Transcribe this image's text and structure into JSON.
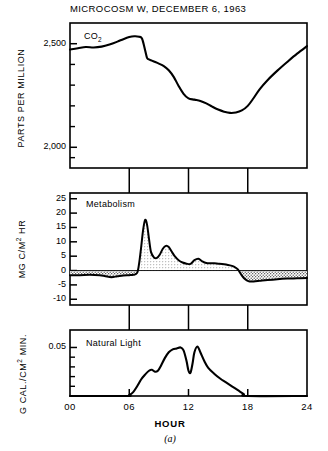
{
  "figure": {
    "title": "MICROCOSM W,  DECEMBER 6, 1963",
    "caption": "(a)",
    "xaxis_name": "HOUR"
  },
  "chart_data": [
    {
      "type": "line",
      "panel": "top",
      "title": "MICROCOSM W,  DECEMBER 6, 1963",
      "series_label": "CO2",
      "ylabel": "PARTS PER MILLION",
      "xlabel": "HOUR",
      "ylim": [
        1900,
        2600
      ],
      "xlim": [
        0,
        24
      ],
      "grid": false,
      "ytick_values": [
        2500,
        2000
      ],
      "ytick_labels": [
        "2,500",
        "2,000"
      ],
      "yminor_values": [
        2600,
        2400,
        2300,
        2200,
        2100,
        1950
      ],
      "xtick_values": [
        0,
        6,
        12,
        18,
        24
      ],
      "xtick_labels": [
        "00",
        "06",
        "12",
        "18",
        "24"
      ],
      "x": [
        0,
        0.8,
        1.6,
        2.4,
        3.2,
        4.0,
        4.8,
        5.4,
        6.0,
        6.5,
        7.0,
        7.3,
        7.6,
        7.8,
        8.0,
        8.2,
        8.5,
        9.0,
        9.5,
        10.0,
        10.5,
        11.0,
        11.5,
        12.0,
        12.6,
        13.2,
        13.8,
        14.4,
        15.0,
        15.6,
        16.2,
        16.8,
        17.4,
        18.0,
        18.6,
        19.2,
        20.0,
        21.0,
        22.0,
        23.0,
        24.0
      ],
      "y": [
        2472,
        2478,
        2484,
        2482,
        2486,
        2496,
        2510,
        2522,
        2532,
        2536,
        2534,
        2524,
        2470,
        2432,
        2424,
        2420,
        2414,
        2404,
        2392,
        2372,
        2340,
        2296,
        2258,
        2236,
        2230,
        2224,
        2212,
        2196,
        2182,
        2172,
        2166,
        2168,
        2178,
        2200,
        2238,
        2280,
        2324,
        2370,
        2412,
        2452,
        2488
      ]
    },
    {
      "type": "area",
      "panel": "middle",
      "series_label": "Metabolism",
      "ylabel": "MG C/M2 HR",
      "xlabel": "HOUR",
      "ylim": [
        -12,
        27
      ],
      "xlim": [
        0,
        24
      ],
      "grid": false,
      "ytick_values": [
        25,
        20,
        15,
        10,
        5,
        0,
        -5,
        -10
      ],
      "ytick_labels": [
        "25",
        "20",
        "15",
        "10",
        "5",
        "0",
        "-5",
        "-10"
      ],
      "xtick_values": [
        0,
        6,
        12,
        18,
        24
      ],
      "xtick_labels": [
        "00",
        "06",
        "12",
        "18",
        "24"
      ],
      "zero_line": 0,
      "x": [
        0,
        1,
        2,
        3,
        3.6,
        4.2,
        4.8,
        5.4,
        6.0,
        6.4,
        6.8,
        7.0,
        7.2,
        7.4,
        7.6,
        7.8,
        8.0,
        8.2,
        8.5,
        8.8,
        9.1,
        9.4,
        9.7,
        10.0,
        10.3,
        10.6,
        11.0,
        11.4,
        11.8,
        12.2,
        12.6,
        13.0,
        13.4,
        13.8,
        14.2,
        14.6,
        15.0,
        15.4,
        15.8,
        16.2,
        16.6,
        17.0,
        17.3,
        17.6,
        17.9,
        18.2,
        18.6,
        19.2,
        20.0,
        21.0,
        22.0,
        23.0,
        24.0
      ],
      "y": [
        -1.6,
        -1.6,
        -1.5,
        -1.6,
        -2.0,
        -2.3,
        -2.0,
        -1.7,
        -1.6,
        -1.5,
        -0.8,
        2.5,
        8.0,
        14.0,
        17.6,
        16.0,
        11.0,
        6.5,
        4.6,
        4.4,
        5.6,
        7.6,
        8.6,
        8.2,
        6.6,
        5.0,
        3.6,
        2.8,
        2.4,
        2.3,
        3.6,
        4.1,
        3.2,
        2.6,
        2.5,
        2.5,
        2.4,
        2.3,
        2.1,
        1.8,
        1.4,
        0.4,
        -1.2,
        -2.6,
        -3.4,
        -3.8,
        -3.8,
        -3.6,
        -3.3,
        -3.0,
        -2.8,
        -2.7,
        -2.6
      ]
    },
    {
      "type": "line",
      "panel": "bottom",
      "series_label": "Natural Light",
      "ylabel": "G CAL./CM2 MIN.",
      "xlabel": "HOUR",
      "ylim": [
        0,
        0.068
      ],
      "xlim": [
        0,
        24
      ],
      "grid": false,
      "ytick_values": [
        0.05
      ],
      "ytick_labels": [
        "0.05"
      ],
      "yminor_values": [
        0.04,
        0.03,
        0.02,
        0.01
      ],
      "xtick_values": [
        0,
        6,
        12,
        18,
        24
      ],
      "xtick_labels": [
        "00",
        "06",
        "12",
        "18",
        "24"
      ],
      "x": [
        0,
        5.6,
        6.0,
        6.4,
        6.8,
        7.2,
        7.6,
        8.0,
        8.3,
        8.6,
        8.9,
        9.2,
        9.6,
        10.0,
        10.4,
        10.8,
        11.2,
        11.5,
        11.8,
        12.0,
        12.2,
        12.4,
        12.6,
        12.9,
        13.2,
        13.6,
        14.0,
        14.6,
        15.2,
        15.8,
        16.4,
        17.0,
        17.6,
        18.0,
        24.0
      ],
      "y": [
        0.0,
        0.0,
        0.001,
        0.004,
        0.01,
        0.017,
        0.022,
        0.026,
        0.027,
        0.025,
        0.026,
        0.031,
        0.039,
        0.045,
        0.048,
        0.049,
        0.05,
        0.047,
        0.036,
        0.026,
        0.024,
        0.033,
        0.045,
        0.051,
        0.045,
        0.036,
        0.029,
        0.023,
        0.018,
        0.014,
        0.01,
        0.006,
        0.002,
        0.0,
        0.0
      ]
    }
  ]
}
